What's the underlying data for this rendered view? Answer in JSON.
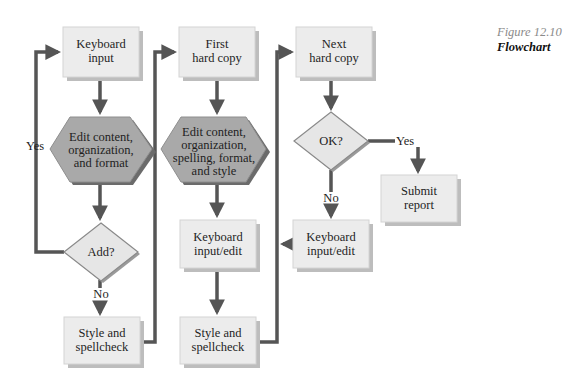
{
  "caption": {
    "figure_number": "Figure 12.10",
    "title": "Flowchart"
  },
  "colors": {
    "box_fill": "#ececec",
    "box_shadow": "#bdbdbd",
    "hexagon_fill": "#a9a9a9",
    "hexagon_shadow": "#6b6b6b",
    "diamond_fill": "#e6e6e6",
    "connector": "#555555"
  },
  "nodes": {
    "keyboard_input": {
      "line1": "Keyboard",
      "line2": "input"
    },
    "edit_1": {
      "line1": "Edit content,",
      "line2": "organization,",
      "line3": "and format"
    },
    "add_decision": {
      "label": "Add?"
    },
    "style_spell_1": {
      "line1": "Style and",
      "line2": "spellcheck"
    },
    "first_hard_copy": {
      "line1": "First",
      "line2": "hard copy"
    },
    "edit_2": {
      "line1": "Edit content,",
      "line2": "organization,",
      "line3": "spelling, format,",
      "line4": "and style"
    },
    "keyboard_edit_1": {
      "line1": "Keyboard",
      "line2": "input/edit"
    },
    "style_spell_2": {
      "line1": "Style and",
      "line2": "spellcheck"
    },
    "next_hard_copy": {
      "line1": "Next",
      "line2": "hard copy"
    },
    "ok_decision": {
      "label": "OK?"
    },
    "keyboard_edit_2": {
      "line1": "Keyboard",
      "line2": "input/edit"
    },
    "submit_report": {
      "line1": "Submit",
      "line2": "report"
    }
  },
  "edge_labels": {
    "add_yes": "Yes",
    "add_no": "No",
    "ok_yes": "Yes",
    "ok_no": "No"
  }
}
